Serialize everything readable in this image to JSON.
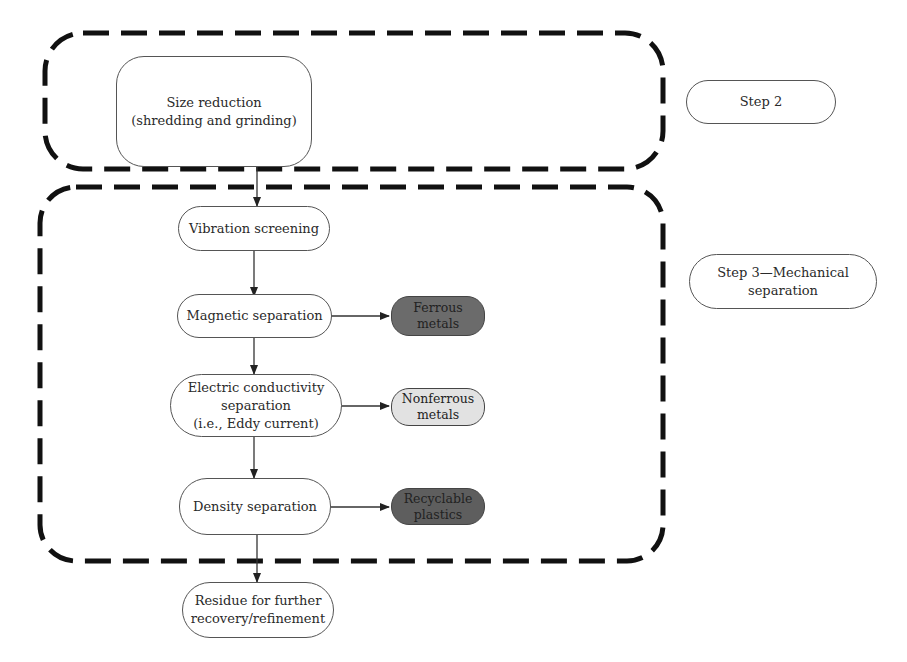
{
  "diagram": {
    "groups": [
      {
        "id": "step2-group",
        "style": "dashed-rounded"
      },
      {
        "id": "step3-group",
        "style": "dashed-rounded"
      }
    ],
    "step_labels": {
      "step2": "Step 2",
      "step3": "Step 3—Mechanical\nseparation"
    },
    "nodes": {
      "size_reduction": "Size reduction\n(shredding and grinding)",
      "vibration_screening": "Vibration screening",
      "magnetic_separation": "Magnetic separation",
      "electric_conductivity": "Electric conductivity\nseparation\n(i.e., Eddy current)",
      "density_separation": "Density separation",
      "residue": "Residue for further\nrecovery/refinement"
    },
    "outputs": {
      "ferrous": "Ferrous\nmetals",
      "nonferrous": "Nonferrous\nmetals",
      "plastics": "Recyclable\nplastics"
    },
    "colors": {
      "ferrous_fill": "#6b6b6b",
      "nonferrous_fill": "#e2e2e2",
      "plastics_fill": "#5e5e5e",
      "dash_stroke": "#111111"
    }
  }
}
